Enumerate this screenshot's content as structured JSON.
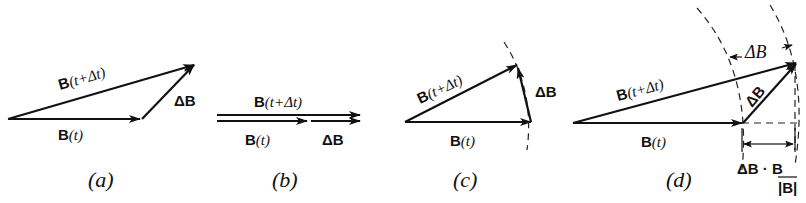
{
  "figure": {
    "panels": [
      {
        "id": "a",
        "caption": "(a)",
        "labels": {
          "b_t_bold": "B",
          "b_t_arg": "(t)",
          "b_tdt_bold": "B",
          "b_tdt_arg": "(t+Δt)",
          "delta_b": "ΔB"
        }
      },
      {
        "id": "b",
        "caption": "(b)",
        "labels": {
          "b_t_bold": "B",
          "b_t_arg": "(t)",
          "b_tdt_bold": "B",
          "b_tdt_arg": "(t+Δt)",
          "delta_b": "ΔB"
        }
      },
      {
        "id": "c",
        "caption": "(c)",
        "labels": {
          "b_t_bold": "B",
          "b_t_arg": "(t)",
          "b_tdt_bold": "B",
          "b_tdt_arg": "(t+Δt)",
          "delta_b": "ΔB"
        }
      },
      {
        "id": "d",
        "caption": "(d)",
        "labels": {
          "b_t_bold": "B",
          "b_t_arg": "(t)",
          "b_tdt_bold": "B",
          "b_tdt_arg": "(t+Δt)",
          "delta_b": "ΔB",
          "delta_mag": "ΔB",
          "projection_num": "ΔB · B",
          "projection_den": "|B|"
        }
      }
    ]
  }
}
